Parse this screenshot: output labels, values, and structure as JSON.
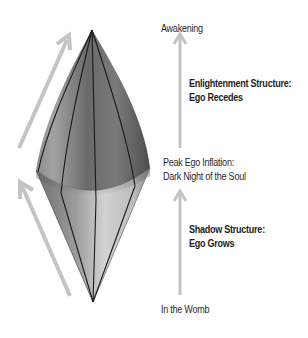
{
  "colors": {
    "arrow": "#bdbdbd",
    "facet_line": "#1a1a1a",
    "text": "#2a2a2a",
    "upper_cone_dark": "#5a5a5a",
    "upper_cone_light": "#a8a8a8",
    "lower_cone_dark": "#6e6e6e",
    "lower_cone_light": "#d4d4d4"
  },
  "stages": {
    "top": "Awakening",
    "middle": {
      "line1": "Peak Ego Inflation:",
      "line2": "Dark Night of the Soul"
    },
    "bottom": "In the Womb"
  },
  "phases": {
    "upper": {
      "line1": "Enlightenment Structure:",
      "line2": "Ego Recedes"
    },
    "lower": {
      "line1": "Shadow Structure:",
      "line2": "Ego Grows"
    }
  },
  "icons": {
    "left_upper_arrow": "arrow-up-right-icon",
    "left_lower_arrow": "arrow-up-left-icon",
    "right_upper_arrow": "arrow-up-icon",
    "right_lower_arrow": "arrow-up-icon",
    "diamond": "double-cone-diamond-icon"
  }
}
